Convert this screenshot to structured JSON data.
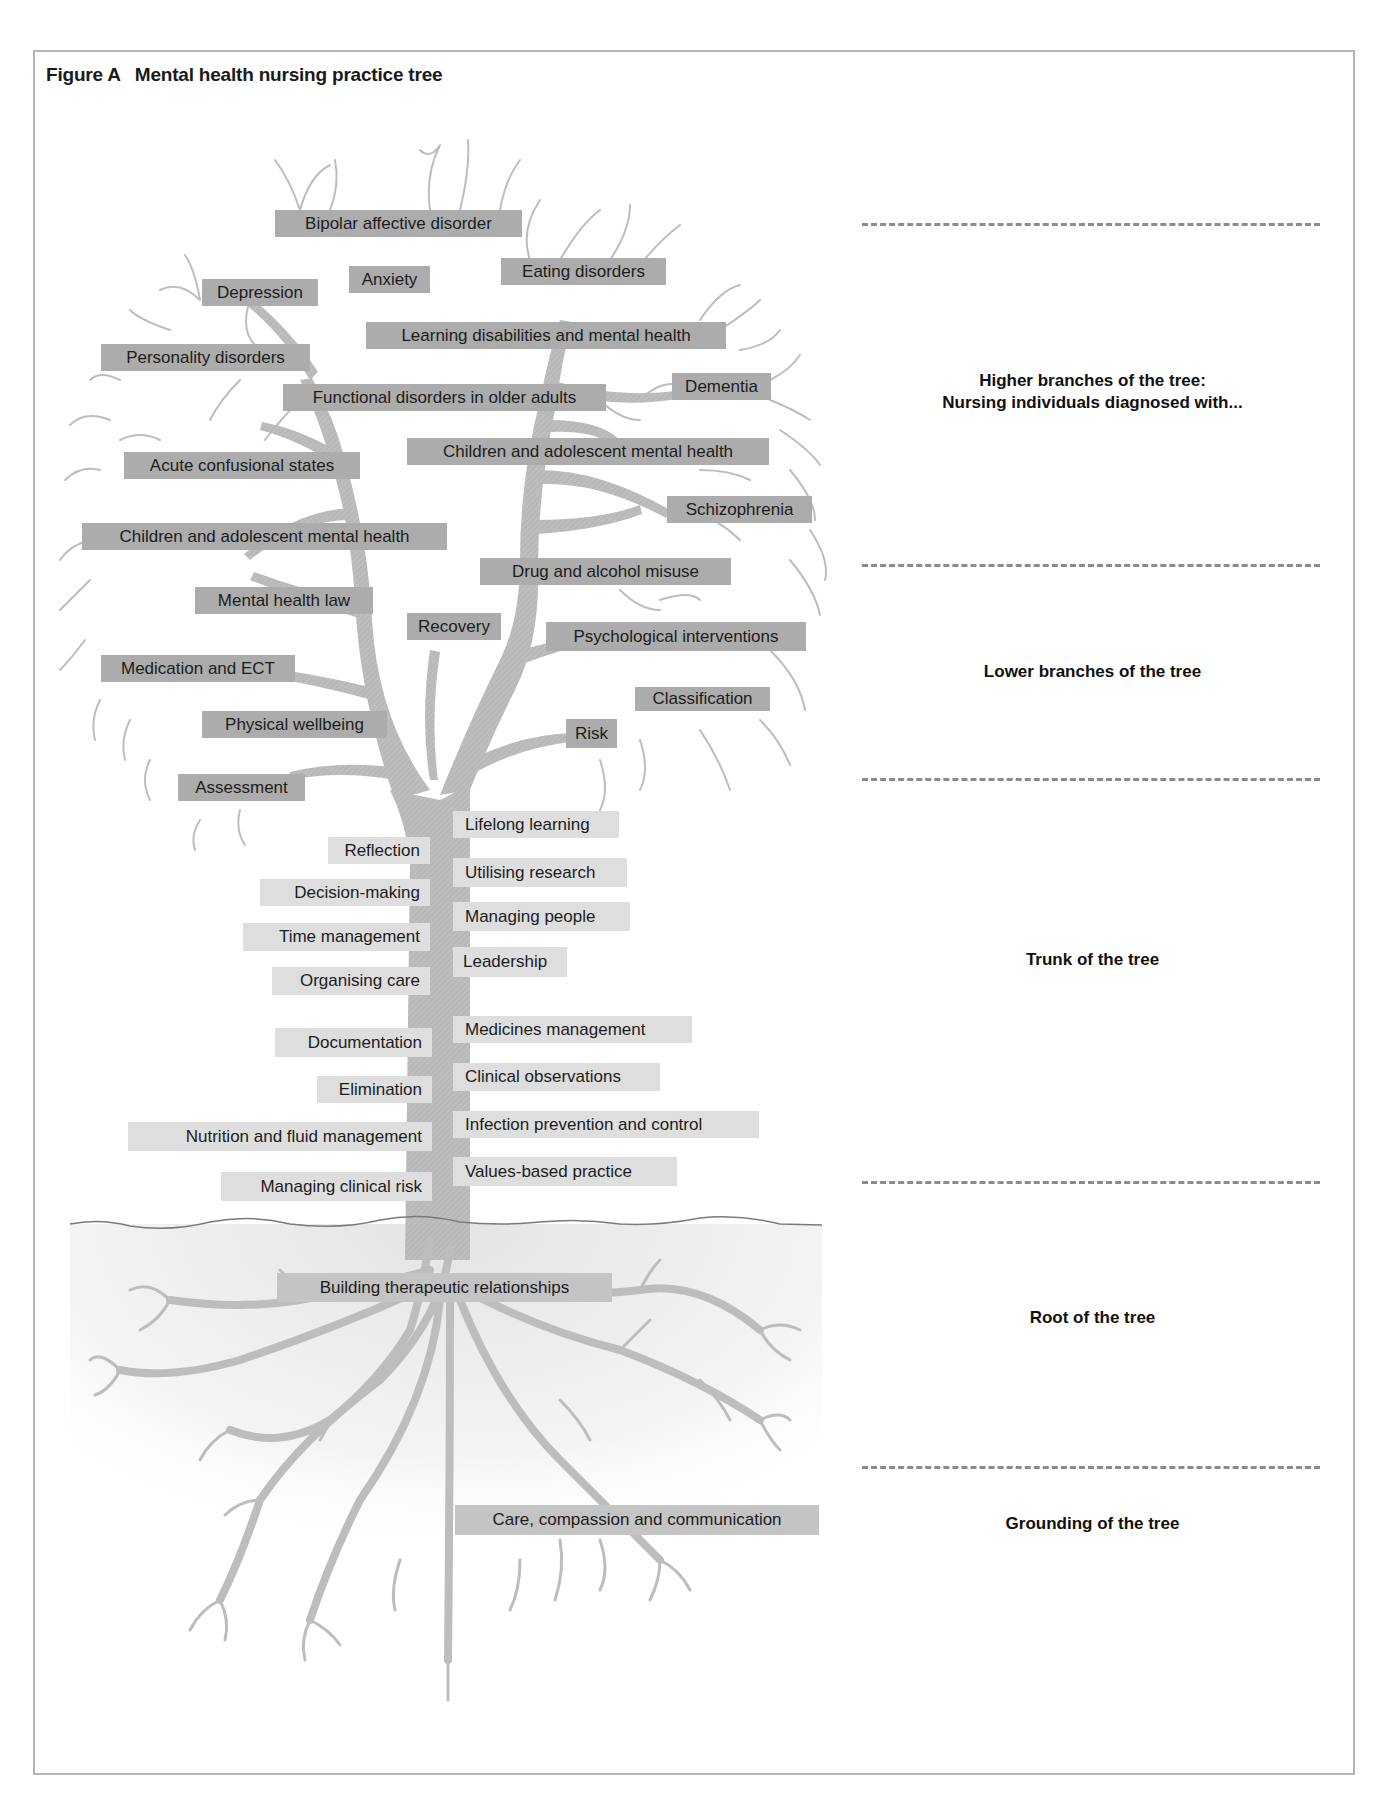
{
  "figure": {
    "label": "Figure A",
    "title": "Mental health nursing practice tree"
  },
  "colors": {
    "crown_label_bg": "#acacac",
    "trunk_label_bg": "#dedede",
    "root_label_bg": "#c4c4c4",
    "branch": "#bcbcbc",
    "dash": "#8c8c8c",
    "frame": "#b5b5b5"
  },
  "tree": {
    "higher_branches": [
      {
        "label": "Bipolar affective disorder"
      },
      {
        "label": "Depression"
      },
      {
        "label": "Anxiety"
      },
      {
        "label": "Eating disorders"
      },
      {
        "label": "Personality disorders"
      },
      {
        "label": "Learning disabilities and mental health"
      },
      {
        "label": "Dementia"
      },
      {
        "label": "Functional disorders in older adults"
      },
      {
        "label": "Acute confusional states"
      },
      {
        "label": "Children and adolescent mental health"
      },
      {
        "label": "Schizophrenia"
      },
      {
        "label": "Children and adolescent mental health"
      }
    ],
    "lower_branches": [
      {
        "label": "Drug and alcohol misuse"
      },
      {
        "label": "Mental health law"
      },
      {
        "label": "Recovery"
      },
      {
        "label": "Psychological interventions"
      },
      {
        "label": "Medication and ECT"
      },
      {
        "label": "Classification"
      },
      {
        "label": "Physical wellbeing"
      },
      {
        "label": "Risk"
      },
      {
        "label": "Assessment"
      }
    ],
    "trunk_left": [
      {
        "label": "Reflection"
      },
      {
        "label": "Decision-making"
      },
      {
        "label": "Time management"
      },
      {
        "label": "Organising care"
      },
      {
        "label": "Documentation"
      },
      {
        "label": "Elimination"
      },
      {
        "label": "Nutrition and fluid management"
      },
      {
        "label": "Managing clinical risk"
      }
    ],
    "trunk_right": [
      {
        "label": "Lifelong learning"
      },
      {
        "label": "Utilising research"
      },
      {
        "label": "Managing people"
      },
      {
        "label": "Leadership"
      },
      {
        "label": "Medicines management"
      },
      {
        "label": "Clinical observations"
      },
      {
        "label": "Infection prevention and control"
      },
      {
        "label": "Values-based practice"
      }
    ],
    "root": [
      {
        "label": "Building therapeutic relationships"
      }
    ],
    "grounding": [
      {
        "label": "Care, compassion and communication"
      }
    ]
  },
  "sections": [
    {
      "line1": "Higher branches of the tree:",
      "line2": "Nursing individuals diagnosed with..."
    },
    {
      "line1": "Lower branches of the tree"
    },
    {
      "line1": "Trunk of the tree"
    },
    {
      "line1": "Root of the tree"
    },
    {
      "line1": "Grounding of the tree"
    }
  ]
}
